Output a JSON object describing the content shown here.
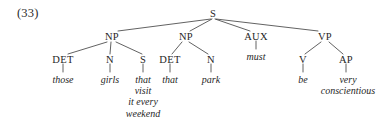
{
  "figure": {
    "example_number": "(33)",
    "background_color": "#ffffff",
    "line_color": "#3a3a3a"
  },
  "tree": {
    "root": {
      "label": "S",
      "x": 213,
      "y": 8
    },
    "nodes": [
      {
        "id": "np1",
        "label": "NP",
        "x": 112,
        "y": 31
      },
      {
        "id": "np2",
        "label": "NP",
        "x": 186,
        "y": 31
      },
      {
        "id": "aux",
        "label": "AUX",
        "x": 256,
        "y": 31
      },
      {
        "id": "vp",
        "label": "VP",
        "x": 325,
        "y": 31
      },
      {
        "id": "det1",
        "label": "DET",
        "x": 63,
        "y": 54
      },
      {
        "id": "n1",
        "label": "N",
        "x": 110,
        "y": 54
      },
      {
        "id": "s2",
        "label": "S",
        "x": 143,
        "y": 54
      },
      {
        "id": "det2",
        "label": "DET",
        "x": 170,
        "y": 54
      },
      {
        "id": "n2",
        "label": "N",
        "x": 211,
        "y": 54
      },
      {
        "id": "v",
        "label": "V",
        "x": 303,
        "y": 54
      },
      {
        "id": "ap",
        "label": "AP",
        "x": 346,
        "y": 54
      }
    ],
    "leaves": [
      {
        "id": "w-those",
        "text": "those",
        "x": 63,
        "y": 74
      },
      {
        "id": "w-girls",
        "text": "girls",
        "x": 110,
        "y": 74
      },
      {
        "id": "w-that-clause",
        "text": "that\nvisit\nit every\nweekend",
        "x": 143,
        "y": 74
      },
      {
        "id": "w-that",
        "text": "that",
        "x": 170,
        "y": 74
      },
      {
        "id": "w-park",
        "text": "park",
        "x": 211,
        "y": 74
      },
      {
        "id": "w-must",
        "text": "must",
        "x": 256,
        "y": 51
      },
      {
        "id": "w-be",
        "text": "be",
        "x": 303,
        "y": 74
      },
      {
        "id": "w-very-consc",
        "text": "very\nconscientious",
        "x": 348,
        "y": 74
      }
    ],
    "branches": [
      {
        "from": "S",
        "to": "NP",
        "x1": 211,
        "y1": 19,
        "x2": 118,
        "y2": 31
      },
      {
        "from": "S",
        "to": "NP",
        "x1": 212,
        "y1": 19,
        "x2": 190,
        "y2": 31
      },
      {
        "from": "S",
        "to": "AUX",
        "x1": 215,
        "y1": 19,
        "x2": 250,
        "y2": 31
      },
      {
        "from": "S",
        "to": "VP",
        "x1": 216,
        "y1": 19,
        "x2": 318,
        "y2": 31
      },
      {
        "from": "NP",
        "to": "DET",
        "x1": 107,
        "y1": 42,
        "x2": 68,
        "y2": 54
      },
      {
        "from": "NP",
        "to": "N",
        "x1": 111,
        "y1": 42,
        "x2": 110,
        "y2": 54
      },
      {
        "from": "NP",
        "to": "S",
        "x1": 116,
        "y1": 42,
        "x2": 142,
        "y2": 54
      },
      {
        "from": "NP2",
        "to": "DET",
        "x1": 182,
        "y1": 42,
        "x2": 172,
        "y2": 54
      },
      {
        "from": "NP2",
        "to": "N",
        "x1": 189,
        "y1": 42,
        "x2": 208,
        "y2": 54
      },
      {
        "from": "VP",
        "to": "V",
        "x1": 321,
        "y1": 42,
        "x2": 305,
        "y2": 54
      },
      {
        "from": "VP",
        "to": "AP",
        "x1": 329,
        "y1": 42,
        "x2": 343,
        "y2": 54
      }
    ],
    "stems": [
      {
        "node": "DET",
        "x": 63,
        "y1": 64,
        "y2": 72
      },
      {
        "node": "N",
        "x": 110,
        "y1": 64,
        "y2": 72
      },
      {
        "node": "S",
        "x": 143,
        "y1": 64,
        "y2": 72
      },
      {
        "node": "DET",
        "x": 170,
        "y1": 64,
        "y2": 72
      },
      {
        "node": "N",
        "x": 211,
        "y1": 64,
        "y2": 72
      },
      {
        "node": "AUX",
        "x": 256,
        "y1": 41,
        "y2": 49
      },
      {
        "node": "V",
        "x": 303,
        "y1": 64,
        "y2": 72
      },
      {
        "node": "AP",
        "x": 346,
        "y1": 64,
        "y2": 72
      }
    ]
  }
}
